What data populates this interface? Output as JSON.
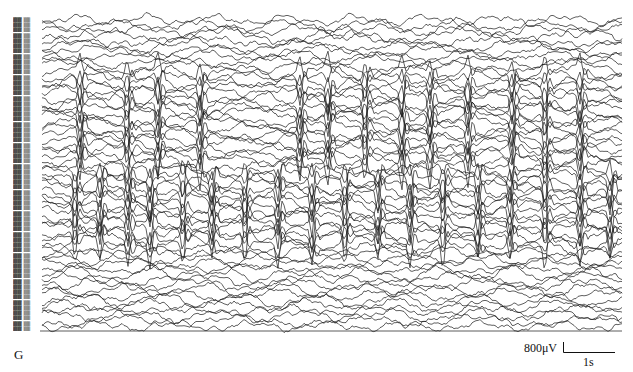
{
  "figure": {
    "panel_letter": "G",
    "scale_bar": {
      "amplitude_label": "800μV",
      "time_label": "1s"
    }
  },
  "chart_data": {
    "type": "line",
    "title": "",
    "xlabel": "",
    "ylabel": "",
    "channel_count": 60,
    "channel_labels_legible": false,
    "grid": false,
    "legend": "none",
    "scale_bar": {
      "amplitude_uV": 800,
      "time_s": 1
    },
    "approx_duration_s": 11,
    "spike_bands": [
      {
        "name": "upper-middle",
        "y_range_px": [
          70,
          170
        ],
        "spike_x_px": [
          80,
          127,
          158,
          200,
          300,
          328,
          365,
          402,
          430,
          468,
          512,
          545,
          580
        ]
      },
      {
        "name": "lower-middle",
        "y_range_px": [
          170,
          250
        ],
        "spike_x_px": [
          75,
          100,
          128,
          150,
          183,
          212,
          245,
          278,
          312,
          345,
          378,
          410,
          443,
          478,
          510,
          545,
          580,
          610
        ]
      }
    ]
  }
}
